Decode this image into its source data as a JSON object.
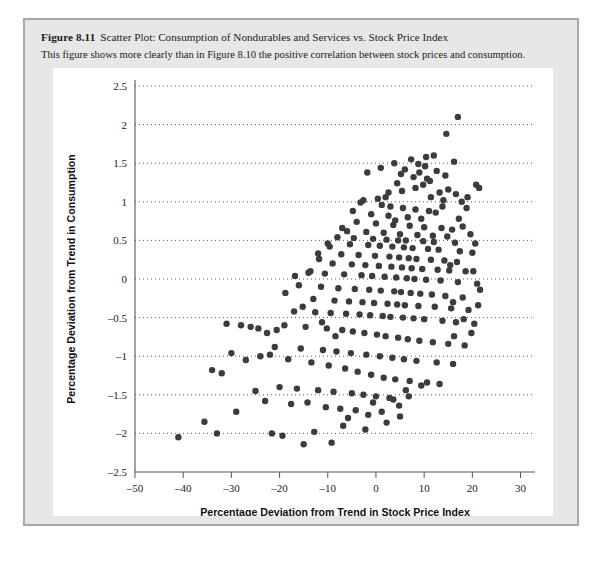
{
  "figure": {
    "number_label": "Figure 8.11",
    "title": "Scatter Plot: Consumption of Nondurables and Services vs. Stock Price Index",
    "subtitle": "This figure shows more clearly than in Figure 8.10 the positive correlation between stock prices and consumption."
  },
  "colors": {
    "page_background": "#ffffff",
    "card_background": "#e7e7e7",
    "card_border": "#a8a8a8",
    "panel_background": "#ffffff",
    "point": "#3c3c3c",
    "axis": "#555555",
    "grid": "#4a4a4a",
    "text": "#1b1b1b"
  },
  "chart_data": {
    "type": "scatter",
    "title": "Scatter Plot: Consumption of Nondurables and Services vs. Stock Price Index",
    "xlabel": "Percentage Deviation from Trend in Stock Price Index",
    "ylabel": "Percentage Deviation from Trend in Consumption",
    "xlim": [
      -50,
      33
    ],
    "ylim": [
      -2.5,
      2.5
    ],
    "xticks": [
      -50,
      -40,
      -30,
      -20,
      -10,
      0,
      10,
      20,
      30
    ],
    "xticklabels": [
      "–50",
      "–40",
      "–30",
      "–20",
      "–10",
      "0",
      "10",
      "20",
      "30"
    ],
    "yticks": [
      -2.5,
      -2,
      -1.5,
      -1,
      -0.5,
      0,
      0.5,
      1,
      1.5,
      2,
      2.5
    ],
    "yticklabels": [
      "–2.5",
      "–2",
      "–1.5",
      "–1",
      "–0.5",
      "0",
      "0.5",
      "1",
      "1.5",
      "2",
      "2.5"
    ],
    "grid": "horizontal-dotted",
    "legend": "none",
    "marker": "circle",
    "marker_size": 4.2,
    "points": [
      [
        17.0,
        2.1
      ],
      [
        14.6,
        1.88
      ],
      [
        16.2,
        1.52
      ],
      [
        20.8,
        1.22
      ],
      [
        21.4,
        1.18
      ],
      [
        7.3,
        1.55
      ],
      [
        8.8,
        1.49
      ],
      [
        10.2,
        1.46
      ],
      [
        6.0,
        1.42
      ],
      [
        9.0,
        1.38
      ],
      [
        5.2,
        1.36
      ],
      [
        7.8,
        1.32
      ],
      [
        10.6,
        1.3
      ],
      [
        11.2,
        1.27
      ],
      [
        4.4,
        1.24
      ],
      [
        13.2,
        1.12
      ],
      [
        14.0,
        1.02
      ],
      [
        2.0,
        1.06
      ],
      [
        0.4,
        1.04
      ],
      [
        -2.6,
        1.02
      ],
      [
        -3.2,
        0.99
      ],
      [
        1.2,
        0.96
      ],
      [
        3.0,
        0.94
      ],
      [
        5.6,
        0.92
      ],
      [
        8.2,
        0.9
      ],
      [
        11.0,
        0.88
      ],
      [
        12.4,
        0.86
      ],
      [
        -1.0,
        0.84
      ],
      [
        2.6,
        0.82
      ],
      [
        6.6,
        0.8
      ],
      [
        9.4,
        0.78
      ],
      [
        4.0,
        0.76
      ],
      [
        -4.0,
        0.74
      ],
      [
        0.0,
        0.72
      ],
      [
        3.6,
        0.7
      ],
      [
        7.0,
        0.69
      ],
      [
        10.0,
        0.67
      ],
      [
        13.6,
        0.66
      ],
      [
        15.8,
        0.64
      ],
      [
        -6.0,
        0.62
      ],
      [
        -2.0,
        0.61
      ],
      [
        1.6,
        0.6
      ],
      [
        5.0,
        0.58
      ],
      [
        8.6,
        0.57
      ],
      [
        11.8,
        0.56
      ],
      [
        14.8,
        0.55
      ],
      [
        -8.0,
        0.54
      ],
      [
        -4.6,
        0.53
      ],
      [
        -0.6,
        0.52
      ],
      [
        2.2,
        0.51
      ],
      [
        4.6,
        0.5
      ],
      [
        6.2,
        0.5
      ],
      [
        9.8,
        0.49
      ],
      [
        12.0,
        0.48
      ],
      [
        16.4,
        0.47
      ],
      [
        -10.0,
        0.46
      ],
      [
        -5.4,
        0.45
      ],
      [
        -1.6,
        0.44
      ],
      [
        0.8,
        0.43
      ],
      [
        3.4,
        0.42
      ],
      [
        5.8,
        0.41
      ],
      [
        7.6,
        0.4
      ],
      [
        10.8,
        0.39
      ],
      [
        13.0,
        0.38
      ],
      [
        17.4,
        0.36
      ],
      [
        20.0,
        0.34
      ],
      [
        -12.0,
        0.33
      ],
      [
        -7.2,
        0.32
      ],
      [
        -3.6,
        0.31
      ],
      [
        -0.2,
        0.3
      ],
      [
        2.8,
        0.29
      ],
      [
        4.8,
        0.28
      ],
      [
        6.8,
        0.27
      ],
      [
        8.4,
        0.26
      ],
      [
        11.4,
        0.25
      ],
      [
        14.2,
        0.24
      ],
      [
        16.8,
        0.22
      ],
      [
        -9.0,
        0.2
      ],
      [
        -5.0,
        0.19
      ],
      [
        -2.2,
        0.18
      ],
      [
        0.6,
        0.17
      ],
      [
        3.2,
        0.16
      ],
      [
        5.4,
        0.15
      ],
      [
        7.4,
        0.14
      ],
      [
        9.6,
        0.13
      ],
      [
        12.8,
        0.12
      ],
      [
        15.2,
        0.11
      ],
      [
        18.6,
        0.1
      ],
      [
        -14.0,
        0.08
      ],
      [
        -10.6,
        0.07
      ],
      [
        -6.6,
        0.06
      ],
      [
        -3.0,
        0.05
      ],
      [
        -0.8,
        0.04
      ],
      [
        1.8,
        0.03
      ],
      [
        4.2,
        0.02
      ],
      [
        6.4,
        0.01
      ],
      [
        8.0,
        0.0
      ],
      [
        10.4,
        -0.01
      ],
      [
        13.4,
        -0.02
      ],
      [
        17.0,
        -0.04
      ],
      [
        21.0,
        -0.06
      ],
      [
        -16.0,
        -0.08
      ],
      [
        -11.4,
        -0.1
      ],
      [
        -7.8,
        -0.12
      ],
      [
        -4.4,
        -0.13
      ],
      [
        -1.4,
        -0.14
      ],
      [
        1.0,
        -0.15
      ],
      [
        3.8,
        -0.16
      ],
      [
        5.2,
        -0.17
      ],
      [
        7.2,
        -0.18
      ],
      [
        9.2,
        -0.19
      ],
      [
        11.6,
        -0.2
      ],
      [
        14.4,
        -0.22
      ],
      [
        18.0,
        -0.24
      ],
      [
        -13.0,
        -0.26
      ],
      [
        -8.6,
        -0.28
      ],
      [
        -5.6,
        -0.29
      ],
      [
        -2.8,
        -0.3
      ],
      [
        -0.4,
        -0.31
      ],
      [
        2.4,
        -0.32
      ],
      [
        4.4,
        -0.33
      ],
      [
        6.0,
        -0.34
      ],
      [
        8.8,
        -0.35
      ],
      [
        12.2,
        -0.36
      ],
      [
        15.6,
        -0.38
      ],
      [
        19.2,
        -0.4
      ],
      [
        -17.0,
        -0.42
      ],
      [
        -12.6,
        -0.43
      ],
      [
        -9.4,
        -0.44
      ],
      [
        -6.2,
        -0.45
      ],
      [
        -3.4,
        -0.46
      ],
      [
        -1.2,
        -0.47
      ],
      [
        1.4,
        -0.48
      ],
      [
        3.0,
        -0.49
      ],
      [
        5.6,
        -0.5
      ],
      [
        7.8,
        -0.51
      ],
      [
        10.0,
        -0.52
      ],
      [
        13.8,
        -0.54
      ],
      [
        16.6,
        -0.56
      ],
      [
        20.4,
        -0.58
      ],
      [
        -19.0,
        -0.6
      ],
      [
        -14.6,
        -0.62
      ],
      [
        -10.2,
        -0.64
      ],
      [
        -7.0,
        -0.66
      ],
      [
        -4.8,
        -0.68
      ],
      [
        -2.4,
        -0.7
      ],
      [
        0.2,
        -0.72
      ],
      [
        2.0,
        -0.74
      ],
      [
        4.6,
        -0.76
      ],
      [
        6.6,
        -0.78
      ],
      [
        9.0,
        -0.8
      ],
      [
        11.8,
        -0.82
      ],
      [
        15.0,
        -0.84
      ],
      [
        18.4,
        -0.86
      ],
      [
        -21.0,
        -0.88
      ],
      [
        -15.6,
        -0.9
      ],
      [
        -11.0,
        -0.92
      ],
      [
        -8.2,
        -0.94
      ],
      [
        -5.2,
        -0.96
      ],
      [
        -2.0,
        -0.98
      ],
      [
        0.8,
        -1.0
      ],
      [
        3.4,
        -1.02
      ],
      [
        5.8,
        -1.04
      ],
      [
        8.4,
        -1.06
      ],
      [
        12.6,
        -1.08
      ],
      [
        16.0,
        -1.1
      ],
      [
        -24.0,
        -1.0
      ],
      [
        -22.0,
        -0.98
      ],
      [
        -27.0,
        -1.05
      ],
      [
        -30.0,
        -0.96
      ],
      [
        -18.2,
        -1.04
      ],
      [
        -13.4,
        -1.08
      ],
      [
        -9.8,
        -1.12
      ],
      [
        -6.4,
        -1.16
      ],
      [
        -3.8,
        -1.2
      ],
      [
        -1.0,
        -1.24
      ],
      [
        1.6,
        -1.28
      ],
      [
        4.0,
        -1.3
      ],
      [
        7.0,
        -1.32
      ],
      [
        10.6,
        -1.34
      ],
      [
        13.2,
        -1.36
      ],
      [
        -20.0,
        -1.4
      ],
      [
        -16.4,
        -1.42
      ],
      [
        -12.0,
        -1.44
      ],
      [
        -8.8,
        -1.46
      ],
      [
        -5.0,
        -1.48
      ],
      [
        -2.6,
        -1.5
      ],
      [
        0.0,
        -1.52
      ],
      [
        2.8,
        -1.54
      ],
      [
        6.2,
        -1.44
      ],
      [
        9.4,
        -1.38
      ],
      [
        -29.0,
        -1.72
      ],
      [
        -23.0,
        -1.58
      ],
      [
        -17.6,
        -1.62
      ],
      [
        -14.2,
        -1.6
      ],
      [
        -10.4,
        -1.66
      ],
      [
        -7.4,
        -1.68
      ],
      [
        -4.2,
        -1.7
      ],
      [
        -0.6,
        -1.6
      ],
      [
        3.6,
        -1.56
      ],
      [
        -41.0,
        -2.05
      ],
      [
        -21.6,
        -2.0
      ],
      [
        -19.4,
        -2.03
      ],
      [
        -12.8,
        -1.98
      ],
      [
        -6.8,
        -1.9
      ],
      [
        -9.2,
        -2.12
      ],
      [
        -15.0,
        -2.14
      ],
      [
        -2.2,
        -1.95
      ],
      [
        2.2,
        -1.86
      ],
      [
        5.0,
        -1.78
      ],
      [
        -25.0,
        -1.45
      ],
      [
        -26.0,
        -0.62
      ],
      [
        -31.0,
        -0.58
      ],
      [
        -28.0,
        -0.6
      ],
      [
        -24.4,
        -0.64
      ],
      [
        -20.6,
        -0.66
      ],
      [
        -22.6,
        -0.7
      ],
      [
        18.8,
        0.92
      ],
      [
        19.6,
        0.58
      ],
      [
        20.6,
        0.46
      ],
      [
        19.0,
        1.06
      ],
      [
        17.8,
        1.0
      ],
      [
        15.4,
        0.18
      ],
      [
        16.0,
        -0.3
      ],
      [
        18.2,
        -0.52
      ],
      [
        19.8,
        -0.7
      ],
      [
        21.2,
        -0.34
      ],
      [
        -34.0,
        -1.18
      ],
      [
        -32.0,
        -1.22
      ],
      [
        -35.6,
        -1.85
      ],
      [
        -33.0,
        -2.0
      ],
      [
        12.0,
        1.6
      ],
      [
        10.4,
        1.58
      ],
      [
        3.8,
        1.5
      ],
      [
        1.0,
        1.44
      ],
      [
        -1.8,
        1.38
      ],
      [
        13.8,
        0.94
      ],
      [
        15.0,
        1.16
      ],
      [
        16.6,
        1.1
      ],
      [
        12.6,
        1.4
      ],
      [
        14.4,
        1.34
      ],
      [
        -4.8,
        0.88
      ],
      [
        -7.0,
        0.66
      ],
      [
        -9.6,
        0.42
      ],
      [
        -11.8,
        0.26
      ],
      [
        -13.6,
        0.1
      ],
      [
        6.8,
        -1.52
      ],
      [
        4.8,
        -1.64
      ],
      [
        1.2,
        -1.72
      ],
      [
        -1.6,
        -1.76
      ],
      [
        -5.8,
        -1.8
      ],
      [
        8.2,
        1.18
      ],
      [
        9.8,
        1.22
      ],
      [
        11.4,
        1.06
      ],
      [
        5.4,
        1.14
      ],
      [
        2.6,
        1.12
      ],
      [
        17.2,
        0.78
      ],
      [
        18.0,
        0.68
      ],
      [
        20.2,
        0.1
      ],
      [
        21.6,
        -0.14
      ],
      [
        16.2,
        -0.74
      ],
      [
        -16.8,
        0.04
      ],
      [
        -18.8,
        -0.18
      ],
      [
        -15.2,
        -0.36
      ],
      [
        -11.2,
        -0.56
      ],
      [
        -8.4,
        -0.74
      ]
    ]
  }
}
